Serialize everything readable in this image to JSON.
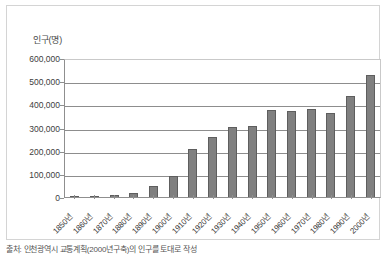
{
  "chart_data": {
    "type": "bar",
    "title": "",
    "ylabel": "인구(명)",
    "xlabel": "",
    "categories": [
      "1850년",
      "1860년",
      "1870년",
      "1880년",
      "1890년",
      "1900년",
      "1910년",
      "1920년",
      "1930년",
      "1940년",
      "1950년",
      "1960년",
      "1970년",
      "1980년",
      "1990년",
      "2000년"
    ],
    "values": [
      3000,
      5000,
      9000,
      18000,
      48000,
      92000,
      208000,
      258000,
      303000,
      305000,
      375000,
      370000,
      380000,
      363000,
      438000,
      525000
    ],
    "ylim": [
      0,
      600000
    ],
    "yticks": [
      "0",
      "100,000",
      "200,000",
      "300,000",
      "400,000",
      "500,000",
      "600,000"
    ],
    "ytick_values": [
      0,
      100000,
      200000,
      300000,
      400000,
      500000,
      600000
    ],
    "grid": true,
    "legend": false,
    "bar_color": "#808080",
    "bar_border_color": "#5e5e5e",
    "gridline_color": "#8d8d8d",
    "axis_color": "#8f8f8f",
    "frame_color": "#d4d4d4",
    "background": "#ffffff"
  },
  "caption": "출처: 인천광역시 교통계획(2000년구축)의 인구를 토대로 작성"
}
